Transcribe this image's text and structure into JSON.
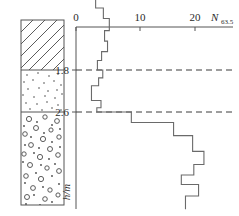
{
  "figure": {
    "title": "",
    "axis_x_label": "N",
    "axis_x_label_sub": "63.5",
    "axis_y_label": "h/m",
    "x_ticks": [
      "0",
      "10",
      "20"
    ],
    "depth_labels": [
      "1.8",
      "2.6"
    ]
  },
  "soil_column": {
    "layers": [
      {
        "name": "clay-fill",
        "pattern": "diagonal-hatch",
        "top_depth": 0.0,
        "bottom_depth": 1.8
      },
      {
        "name": "sand",
        "pattern": "fine-dots",
        "top_depth": 1.8,
        "bottom_depth": 2.6
      },
      {
        "name": "gravel",
        "pattern": "circles-and-dots",
        "top_depth": 2.6,
        "bottom_depth": 5.2
      }
    ]
  },
  "chart_data": {
    "type": "line",
    "title": "",
    "xlabel": "N63.5",
    "ylabel": "h/m",
    "xlim": [
      0,
      23
    ],
    "ylim": [
      0,
      5.2
    ],
    "grid": false,
    "legend_position": "none",
    "x_ticks": [
      0,
      10,
      20
    ],
    "y_ticks": [
      1.8,
      2.6
    ],
    "y_axis_inverted": true,
    "annotations": [
      {
        "text": "1.8",
        "y": 1.8,
        "style": "dashed-horizontal-line"
      },
      {
        "text": "2.6",
        "y": 2.6,
        "style": "dashed-horizontal-line"
      }
    ],
    "series": [
      {
        "name": "N63.5 blow count vs depth",
        "step": "post",
        "points": [
          {
            "depth": 0.15,
            "value": 5.5
          },
          {
            "depth": 0.4,
            "value": 5.5
          },
          {
            "depth": 0.4,
            "value": 3.3
          },
          {
            "depth": 0.62,
            "value": 3.3
          },
          {
            "depth": 0.62,
            "value": 4.6
          },
          {
            "depth": 0.82,
            "value": 4.6
          },
          {
            "depth": 0.82,
            "value": 5.6
          },
          {
            "depth": 1.05,
            "value": 5.6
          },
          {
            "depth": 1.05,
            "value": 4.8
          },
          {
            "depth": 1.25,
            "value": 4.8
          },
          {
            "depth": 1.25,
            "value": 5.3
          },
          {
            "depth": 1.45,
            "value": 5.3
          },
          {
            "depth": 1.45,
            "value": 4.3
          },
          {
            "depth": 1.62,
            "value": 4.3
          },
          {
            "depth": 1.62,
            "value": 3.6
          },
          {
            "depth": 1.8,
            "value": 3.6
          },
          {
            "depth": 1.8,
            "value": 4.5
          },
          {
            "depth": 1.95,
            "value": 4.5
          },
          {
            "depth": 1.95,
            "value": 3.8
          },
          {
            "depth": 2.1,
            "value": 3.8
          },
          {
            "depth": 2.1,
            "value": 2.6
          },
          {
            "depth": 2.38,
            "value": 2.6
          },
          {
            "depth": 2.38,
            "value": 4.2
          },
          {
            "depth": 2.52,
            "value": 4.2
          },
          {
            "depth": 2.52,
            "value": 3.5
          },
          {
            "depth": 2.6,
            "value": 3.5
          },
          {
            "depth": 2.6,
            "value": 9.3
          },
          {
            "depth": 2.8,
            "value": 9.3
          },
          {
            "depth": 2.8,
            "value": 16.4
          },
          {
            "depth": 3.05,
            "value": 16.4
          },
          {
            "depth": 3.05,
            "value": 19.6
          },
          {
            "depth": 3.35,
            "value": 19.6
          },
          {
            "depth": 3.35,
            "value": 21.5
          },
          {
            "depth": 3.6,
            "value": 21.5
          },
          {
            "depth": 3.6,
            "value": 19.8
          },
          {
            "depth": 3.8,
            "value": 19.8
          },
          {
            "depth": 3.8,
            "value": 17.7
          },
          {
            "depth": 3.98,
            "value": 17.7
          },
          {
            "depth": 3.98,
            "value": 20.6
          },
          {
            "depth": 4.2,
            "value": 20.6
          },
          {
            "depth": 4.2,
            "value": 18.4
          },
          {
            "depth": 4.45,
            "value": 18.4
          }
        ]
      }
    ]
  }
}
